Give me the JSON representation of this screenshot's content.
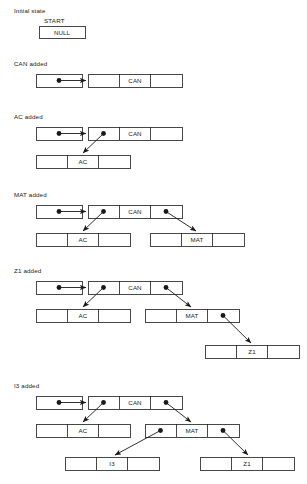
{
  "figure": {
    "background_color": "#ffffff",
    "line_color": "#1a1a1a",
    "text_color": "#222222"
  },
  "stages": [
    {
      "id": "initial",
      "caption": "Initial state",
      "start_label": "START",
      "root_cell_text": "NULL"
    },
    {
      "id": "can-added",
      "caption": "CAN added",
      "inserted_key": "CAN",
      "nodes": [
        {
          "key": "CAN",
          "left_ptr": "null",
          "right_ptr": "null"
        }
      ]
    },
    {
      "id": "ac-added",
      "caption": "AC added",
      "inserted_key": "AC",
      "nodes": [
        {
          "key": "CAN",
          "left_ptr": "AC",
          "right_ptr": "null"
        },
        {
          "key": "AC",
          "left_ptr": "null",
          "right_ptr": "null"
        }
      ]
    },
    {
      "id": "mat-added",
      "caption": "MAT added",
      "inserted_key": "MAT",
      "nodes": [
        {
          "key": "CAN",
          "left_ptr": "AC",
          "right_ptr": "MAT"
        },
        {
          "key": "AC",
          "left_ptr": "null",
          "right_ptr": "null"
        },
        {
          "key": "MAT",
          "left_ptr": "null",
          "right_ptr": "null"
        }
      ]
    },
    {
      "id": "z1-added",
      "caption": "Z1 added",
      "inserted_key": "Z1",
      "nodes": [
        {
          "key": "CAN",
          "left_ptr": "AC",
          "right_ptr": "MAT"
        },
        {
          "key": "AC",
          "left_ptr": "null",
          "right_ptr": "null"
        },
        {
          "key": "MAT",
          "left_ptr": "null",
          "right_ptr": "Z1"
        },
        {
          "key": "Z1",
          "left_ptr": "null",
          "right_ptr": "null"
        }
      ]
    },
    {
      "id": "i3-added",
      "caption": "I3 added",
      "inserted_key": "I3",
      "nodes": [
        {
          "key": "CAN",
          "left_ptr": "AC",
          "right_ptr": "MAT"
        },
        {
          "key": "AC",
          "left_ptr": "null",
          "right_ptr": "null"
        },
        {
          "key": "MAT",
          "left_ptr": "I3",
          "right_ptr": "Z1"
        },
        {
          "key": "I3",
          "left_ptr": "null",
          "right_ptr": "null"
        },
        {
          "key": "Z1",
          "left_ptr": "null",
          "right_ptr": "null"
        }
      ]
    }
  ],
  "labels": {
    "caption_initial": "Initial state",
    "caption_can": "CAN added",
    "caption_ac": "AC added",
    "caption_mat": "MAT added",
    "caption_z1": "Z1 added",
    "caption_i3": "I3 added",
    "start": "START",
    "null_cell": "NULL",
    "key_can": "CAN",
    "key_ac": "AC",
    "key_mat": "MAT",
    "key_z1": "Z1",
    "key_i3": "I3",
    "key_can_2": "CAN",
    "key_can_3": "CAN",
    "key_can_4": "CAN",
    "key_can_5": "CAN",
    "key_ac_2": "AC",
    "key_ac_3": "AC",
    "key_ac_4": "AC",
    "key_mat_2": "MAT",
    "key_mat_3": "MAT",
    "key_z1_2": "Z1"
  }
}
